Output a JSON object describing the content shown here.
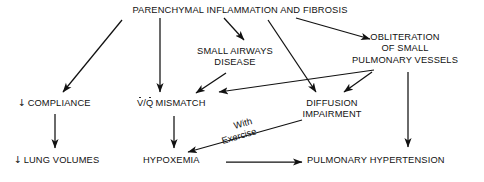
{
  "diagram": {
    "type": "flowchart",
    "nodes": [
      {
        "id": "parenchymal",
        "label": "PARENCHYMAL INFLAMMATION AND FIBROSIS"
      },
      {
        "id": "small_airways_1",
        "label": "SMALL AIRWAYS"
      },
      {
        "id": "small_airways_2",
        "label": "DISEASE"
      },
      {
        "id": "obliteration_1",
        "label": "OBLITERATION"
      },
      {
        "id": "obliteration_2",
        "label": "OF SMALL"
      },
      {
        "id": "obliteration_3",
        "label": "PULMONARY VESSELS"
      },
      {
        "id": "compliance_arrow",
        "label": "↓"
      },
      {
        "id": "compliance",
        "label": "COMPLIANCE"
      },
      {
        "id": "vq_v",
        "label": "V"
      },
      {
        "id": "vq_slash",
        "label": "/"
      },
      {
        "id": "vq_q",
        "label": "Q"
      },
      {
        "id": "vq_rest",
        "label": "MISMATCH"
      },
      {
        "id": "diffusion_1",
        "label": "DIFFUSION"
      },
      {
        "id": "diffusion_2",
        "label": "IMPAIRMENT"
      },
      {
        "id": "lung_volumes_arrow",
        "label": "↓"
      },
      {
        "id": "lung_volumes",
        "label": "LUNG VOLUMES"
      },
      {
        "id": "hypoxemia",
        "label": "HYPOXEMIA"
      },
      {
        "id": "pulmonary_hypertension",
        "label": "PULMONARY HYPERTENSION"
      }
    ],
    "edge_labels": [
      {
        "id": "with",
        "label": "With"
      },
      {
        "id": "exercise",
        "label": "Exercise"
      }
    ],
    "edges": [
      {
        "from": "parenchymal",
        "to": "compliance"
      },
      {
        "from": "parenchymal",
        "to": "vq_mismatch"
      },
      {
        "from": "parenchymal",
        "to": "small_airways_disease"
      },
      {
        "from": "parenchymal",
        "to": "diffusion_impairment"
      },
      {
        "from": "parenchymal",
        "to": "obliteration_of_small_pulmonary_vessels"
      },
      {
        "from": "small_airways_disease",
        "to": "vq_mismatch"
      },
      {
        "from": "obliteration_of_small_pulmonary_vessels",
        "to": "vq_mismatch"
      },
      {
        "from": "obliteration_of_small_pulmonary_vessels",
        "to": "diffusion_impairment"
      },
      {
        "from": "obliteration_of_small_pulmonary_vessels",
        "to": "pulmonary_hypertension"
      },
      {
        "from": "compliance",
        "to": "lung_volumes"
      },
      {
        "from": "vq_mismatch",
        "to": "hypoxemia"
      },
      {
        "from": "diffusion_impairment",
        "to": "hypoxemia",
        "label": "With Exercise"
      },
      {
        "from": "hypoxemia",
        "to": "pulmonary_hypertension"
      }
    ],
    "colors": {
      "line": "#111111",
      "text": "#111111",
      "background": "#ffffff"
    }
  }
}
